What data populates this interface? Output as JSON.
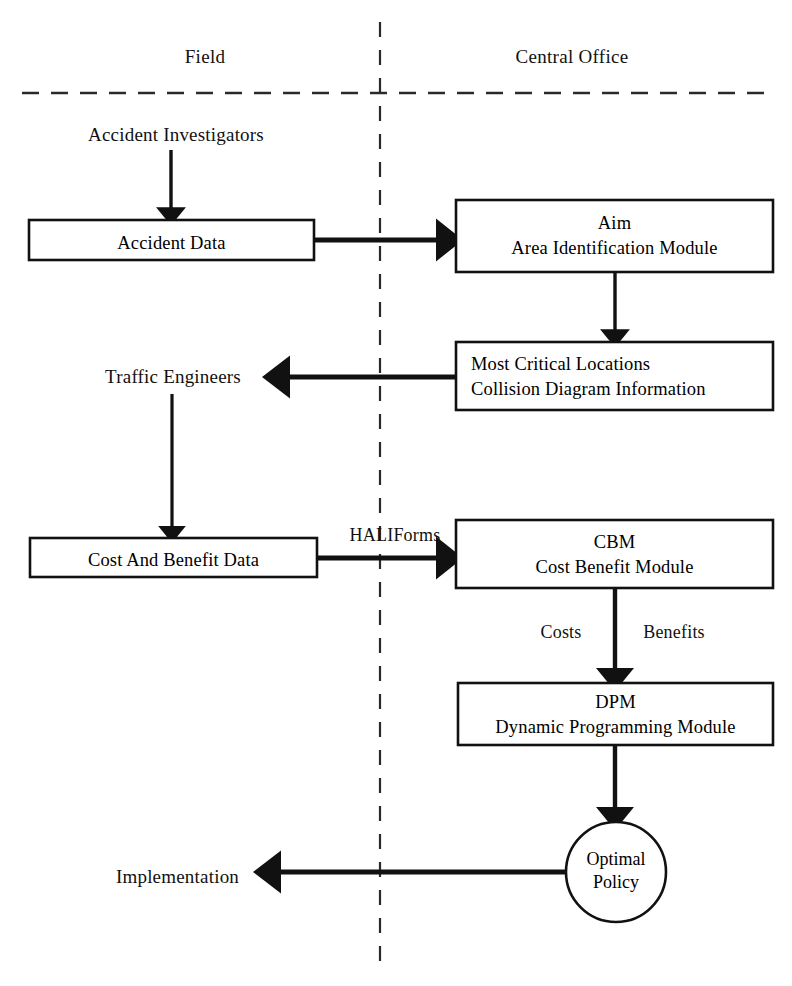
{
  "diagram": {
    "zones": [
      {
        "id": "field",
        "label": "Field"
      },
      {
        "id": "central_office",
        "label": "Central Office"
      }
    ],
    "actors": [
      {
        "id": "accident_investigators",
        "label": "Accident Investigators"
      },
      {
        "id": "traffic_engineers",
        "label": "Traffic Engineers"
      },
      {
        "id": "implementation",
        "label": "Implementation"
      }
    ],
    "boxes": [
      {
        "id": "accident_data",
        "zone": "field",
        "lines": [
          "Accident Data"
        ],
        "align": "center"
      },
      {
        "id": "aim",
        "zone": "central_office",
        "lines": [
          "Aim",
          "Area Identification Module"
        ],
        "align": "center"
      },
      {
        "id": "most_critical_locations",
        "zone": "central_office",
        "lines": [
          "Most Critical Locations",
          "Collision Diagram Information"
        ],
        "align": "left"
      },
      {
        "id": "cost_and_benefit_data",
        "zone": "field",
        "lines": [
          "Cost And Benefit Data"
        ],
        "align": "center"
      },
      {
        "id": "cbm",
        "zone": "central_office",
        "lines": [
          "CBM",
          "Cost Benefit Module"
        ],
        "align": "center"
      },
      {
        "id": "dpm",
        "zone": "central_office",
        "lines": [
          "DPM",
          "Dynamic Programming Module"
        ],
        "align": "center"
      }
    ],
    "terminal": {
      "id": "optimal_policy",
      "zone": "central_office",
      "shape": "circle",
      "lines": [
        "Optimal",
        "Policy"
      ]
    },
    "edge_labels": [
      {
        "id": "hali_forms",
        "label": "HALIForms"
      },
      {
        "id": "costs",
        "label": "Costs"
      },
      {
        "id": "benefits",
        "label": "Benefits"
      }
    ],
    "colors": {
      "stroke": "#111111",
      "background": "#ffffff",
      "text": "#111111"
    }
  }
}
